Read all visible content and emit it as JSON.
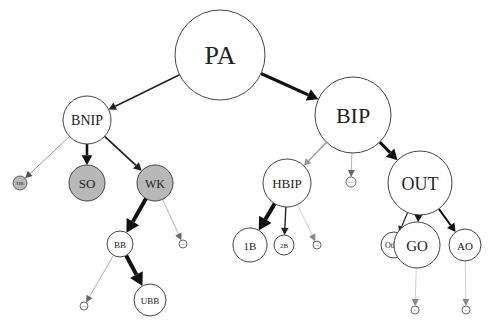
{
  "diagram": {
    "type": "tree",
    "nodes": [
      {
        "id": "PA",
        "label": "PA",
        "x": 220,
        "y": 55,
        "r": 45,
        "fill": "#ffffff",
        "font": 26
      },
      {
        "id": "BNIP",
        "label": "BNIP",
        "x": 87,
        "y": 120,
        "r": 24,
        "fill": "#ffffff",
        "font": 14
      },
      {
        "id": "BIP",
        "label": "BIP",
        "x": 353,
        "y": 115,
        "r": 38,
        "fill": "#ffffff",
        "font": 22
      },
      {
        "id": "HR",
        "label": "HR",
        "x": 20,
        "y": 183,
        "r": 7,
        "fill": "#b8b8b8",
        "font": 5
      },
      {
        "id": "SO",
        "label": "SO",
        "x": 87,
        "y": 183,
        "r": 18,
        "fill": "#b8b8b8",
        "font": 13
      },
      {
        "id": "WK",
        "label": "WK",
        "x": 155,
        "y": 183,
        "r": 18,
        "fill": "#b8b8b8",
        "font": 12
      },
      {
        "id": "BB",
        "label": "BB",
        "x": 120,
        "y": 244,
        "r": 13,
        "fill": "#ffffff",
        "font": 9
      },
      {
        "id": "WK_small",
        "label": "HBP",
        "x": 183,
        "y": 244,
        "r": 4,
        "fill": "#ffffff",
        "font": 2.5
      },
      {
        "id": "BB_small",
        "label": "IBB",
        "x": 84,
        "y": 306,
        "r": 4,
        "fill": "#ffffff",
        "font": 2.5
      },
      {
        "id": "UBB",
        "label": "UBB",
        "x": 150,
        "y": 300,
        "r": 16,
        "fill": "#ffffff",
        "font": 9
      },
      {
        "id": "HBIP",
        "label": "HBIP",
        "x": 287,
        "y": 183,
        "r": 24,
        "fill": "#ffffff",
        "font": 13
      },
      {
        "id": "BIP_small",
        "label": "ROE",
        "x": 351,
        "y": 182,
        "r": 5,
        "fill": "#ffffff",
        "font": 2.5
      },
      {
        "id": "OUT",
        "label": "OUT",
        "x": 420,
        "y": 183,
        "r": 32,
        "fill": "#ffffff",
        "font": 18
      },
      {
        "id": "1B",
        "label": "1B",
        "x": 250,
        "y": 245,
        "r": 17,
        "fill": "#ffffff",
        "font": 11
      },
      {
        "id": "2B",
        "label": "2B",
        "x": 284,
        "y": 245,
        "r": 10,
        "fill": "#ffffff",
        "font": 7
      },
      {
        "id": "HBIP_small",
        "label": "3B",
        "x": 317,
        "y": 245,
        "r": 4,
        "fill": "#ffffff",
        "font": 2.5
      },
      {
        "id": "Other",
        "label": "Other",
        "x": 394,
        "y": 245,
        "r": 13,
        "fill": "#ffffff",
        "font": 8
      },
      {
        "id": "GO",
        "label": "GO",
        "x": 417,
        "y": 245,
        "r": 23,
        "fill": "#ffffff",
        "font": 15
      },
      {
        "id": "AO",
        "label": "AO",
        "x": 465,
        "y": 245,
        "r": 16,
        "fill": "#ffffff",
        "font": 11
      },
      {
        "id": "GO_small",
        "label": "DP",
        "x": 415,
        "y": 310,
        "r": 4,
        "fill": "#ffffff",
        "font": 2.5
      },
      {
        "id": "AO_small",
        "label": "SF",
        "x": 466,
        "y": 310,
        "r": 4,
        "fill": "#ffffff",
        "font": 2.5
      }
    ],
    "edges": [
      {
        "from": "PA",
        "to": "BNIP",
        "width": 1.6,
        "color": "#222222"
      },
      {
        "from": "PA",
        "to": "BIP",
        "width": 3.2,
        "color": "#111111"
      },
      {
        "from": "BNIP",
        "to": "HR",
        "width": 0.6,
        "color": "#555555"
      },
      {
        "from": "BNIP",
        "to": "SO",
        "width": 2.6,
        "color": "#111111"
      },
      {
        "from": "BNIP",
        "to": "WK",
        "width": 1.8,
        "color": "#222222"
      },
      {
        "from": "WK",
        "to": "BB",
        "width": 4.0,
        "color": "#111111"
      },
      {
        "from": "WK",
        "to": "WK_small",
        "width": 0.5,
        "color": "#666666"
      },
      {
        "from": "BB",
        "to": "BB_small",
        "width": 0.5,
        "color": "#666666"
      },
      {
        "from": "BB",
        "to": "UBB",
        "width": 4.0,
        "color": "#111111"
      },
      {
        "from": "BIP",
        "to": "HBIP",
        "width": 1.4,
        "color": "#999999"
      },
      {
        "from": "BIP",
        "to": "BIP_small",
        "width": 0.5,
        "color": "#666666"
      },
      {
        "from": "BIP",
        "to": "OUT",
        "width": 3.0,
        "color": "#111111"
      },
      {
        "from": "HBIP",
        "to": "1B",
        "width": 4.0,
        "color": "#111111"
      },
      {
        "from": "HBIP",
        "to": "2B",
        "width": 1.4,
        "color": "#222222"
      },
      {
        "from": "HBIP",
        "to": "HBIP_small",
        "width": 0.4,
        "color": "#888888"
      },
      {
        "from": "OUT",
        "to": "Other",
        "width": 1.2,
        "color": "#222222"
      },
      {
        "from": "OUT",
        "to": "GO",
        "width": 2.2,
        "color": "#111111"
      },
      {
        "from": "OUT",
        "to": "AO",
        "width": 2.0,
        "color": "#111111"
      },
      {
        "from": "GO",
        "to": "GO_small",
        "width": 0.4,
        "color": "#888888"
      },
      {
        "from": "AO",
        "to": "AO_small",
        "width": 0.4,
        "color": "#888888"
      }
    ]
  }
}
